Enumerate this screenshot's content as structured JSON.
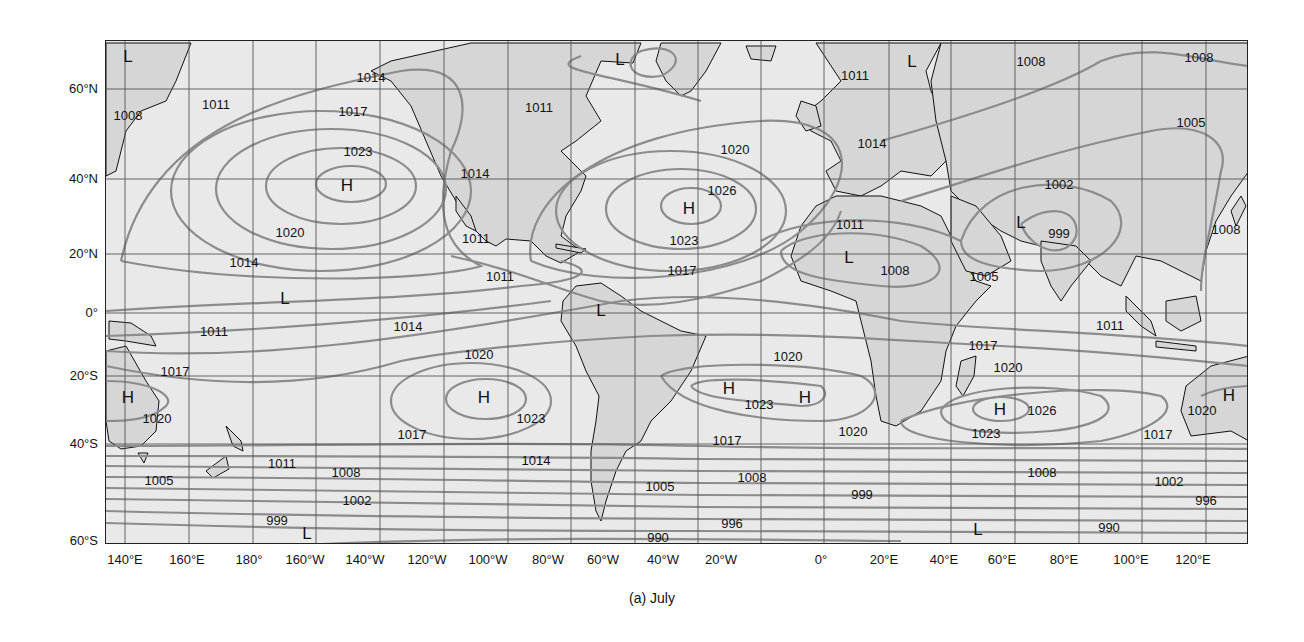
{
  "figure": {
    "caption": "(a) July",
    "type": "Mean sea-level pressure isobar map (mb)"
  },
  "axes": {
    "latitude_labels": [
      {
        "text": "60°N",
        "y": 88
      },
      {
        "text": "40°N",
        "y": 178
      },
      {
        "text": "20°N",
        "y": 253
      },
      {
        "text": "0°",
        "y": 312
      },
      {
        "text": "20°S",
        "y": 375
      },
      {
        "text": "40°S",
        "y": 443
      },
      {
        "text": "60°S",
        "y": 540
      }
    ],
    "longitude_labels": [
      {
        "text": "140°E",
        "x": 125
      },
      {
        "text": "160°E",
        "x": 187
      },
      {
        "text": "180°",
        "x": 249
      },
      {
        "text": "160°W",
        "x": 305
      },
      {
        "text": "140°W",
        "x": 365
      },
      {
        "text": "120°W",
        "x": 427
      },
      {
        "text": "100°W",
        "x": 488
      },
      {
        "text": "80°W",
        "x": 548
      },
      {
        "text": "60°W",
        "x": 603
      },
      {
        "text": "40°W",
        "x": 663
      },
      {
        "text": "20°W",
        "x": 721
      },
      {
        "text": "0°",
        "x": 821
      },
      {
        "text": "20°E",
        "x": 884
      },
      {
        "text": "40°E",
        "x": 944
      },
      {
        "text": "60°E",
        "x": 1002
      },
      {
        "text": "80°E",
        "x": 1064
      },
      {
        "text": "100°E",
        "x": 1131
      },
      {
        "text": "120°E",
        "x": 1193
      }
    ]
  },
  "pressure_centers": [
    {
      "type": "L",
      "x": 128,
      "y": 57
    },
    {
      "type": "L",
      "x": 620,
      "y": 60
    },
    {
      "type": "L",
      "x": 912,
      "y": 62
    },
    {
      "type": "H",
      "x": 347,
      "y": 186
    },
    {
      "type": "H",
      "x": 689,
      "y": 209
    },
    {
      "type": "L",
      "x": 1021,
      "y": 223
    },
    {
      "type": "L",
      "x": 849,
      "y": 258
    },
    {
      "type": "L",
      "x": 285,
      "y": 299
    },
    {
      "type": "L",
      "x": 601,
      "y": 311
    },
    {
      "type": "H",
      "x": 128,
      "y": 398
    },
    {
      "type": "H",
      "x": 484,
      "y": 398
    },
    {
      "type": "H",
      "x": 729,
      "y": 389
    },
    {
      "type": "H",
      "x": 805,
      "y": 398
    },
    {
      "type": "H",
      "x": 1000,
      "y": 410
    },
    {
      "type": "H",
      "x": 1229,
      "y": 396
    },
    {
      "type": "L",
      "x": 307,
      "y": 534
    },
    {
      "type": "L",
      "x": 978,
      "y": 530
    }
  ],
  "isobar_labels": [
    {
      "text": "1014",
      "x": 371,
      "y": 77
    },
    {
      "text": "1008",
      "x": 1031,
      "y": 61
    },
    {
      "text": "1008",
      "x": 1199,
      "y": 57
    },
    {
      "text": "1011",
      "x": 216,
      "y": 104
    },
    {
      "text": "1008",
      "x": 128,
      "y": 115
    },
    {
      "text": "1017",
      "x": 353,
      "y": 111
    },
    {
      "text": "1011",
      "x": 539,
      "y": 107
    },
    {
      "text": "1011",
      "x": 855,
      "y": 75
    },
    {
      "text": "1005",
      "x": 1191,
      "y": 122
    },
    {
      "text": "1023",
      "x": 358,
      "y": 151
    },
    {
      "text": "1020",
      "x": 735,
      "y": 149
    },
    {
      "text": "1014",
      "x": 872,
      "y": 143
    },
    {
      "text": "1014",
      "x": 475,
      "y": 173
    },
    {
      "text": "1026",
      "x": 722,
      "y": 190
    },
    {
      "text": "1002",
      "x": 1059,
      "y": 184
    },
    {
      "text": "1023",
      "x": 684,
      "y": 240
    },
    {
      "text": "1011",
      "x": 850,
      "y": 224
    },
    {
      "text": "999",
      "x": 1059,
      "y": 233
    },
    {
      "text": "1008",
      "x": 1226,
      "y": 229
    },
    {
      "text": "1020",
      "x": 290,
      "y": 232
    },
    {
      "text": "1011",
      "x": 476,
      "y": 238
    },
    {
      "text": "1014",
      "x": 244,
      "y": 262
    },
    {
      "text": "1011",
      "x": 500,
      "y": 276
    },
    {
      "text": "1017",
      "x": 682,
      "y": 270
    },
    {
      "text": "1008",
      "x": 895,
      "y": 270
    },
    {
      "text": "1005",
      "x": 984,
      "y": 276
    },
    {
      "text": "1011",
      "x": 214,
      "y": 331
    },
    {
      "text": "1014",
      "x": 408,
      "y": 326
    },
    {
      "text": "1011",
      "x": 1110,
      "y": 325
    },
    {
      "text": "1020",
      "x": 479,
      "y": 354
    },
    {
      "text": "1020",
      "x": 788,
      "y": 356
    },
    {
      "text": "1017",
      "x": 983,
      "y": 345
    },
    {
      "text": "1020",
      "x": 1008,
      "y": 367
    },
    {
      "text": "1017",
      "x": 175,
      "y": 371
    },
    {
      "text": "1023",
      "x": 531,
      "y": 418
    },
    {
      "text": "1023",
      "x": 759,
      "y": 404
    },
    {
      "text": "1026",
      "x": 1042,
      "y": 410
    },
    {
      "text": "1020",
      "x": 157,
      "y": 418
    },
    {
      "text": "1020",
      "x": 1202,
      "y": 410
    },
    {
      "text": "1017",
      "x": 412,
      "y": 434
    },
    {
      "text": "1017",
      "x": 727,
      "y": 440
    },
    {
      "text": "1020",
      "x": 853,
      "y": 431
    },
    {
      "text": "1023",
      "x": 986,
      "y": 433
    },
    {
      "text": "1017",
      "x": 1158,
      "y": 434
    },
    {
      "text": "1014",
      "x": 536,
      "y": 460
    },
    {
      "text": "1011",
      "x": 282,
      "y": 463
    },
    {
      "text": "1008",
      "x": 346,
      "y": 472
    },
    {
      "text": "1008",
      "x": 752,
      "y": 477
    },
    {
      "text": "1008",
      "x": 1042,
      "y": 472
    },
    {
      "text": "1005",
      "x": 159,
      "y": 480
    },
    {
      "text": "1005",
      "x": 660,
      "y": 486
    },
    {
      "text": "999",
      "x": 862,
      "y": 494
    },
    {
      "text": "1002",
      "x": 1169,
      "y": 481
    },
    {
      "text": "1002",
      "x": 357,
      "y": 500
    },
    {
      "text": "996",
      "x": 1206,
      "y": 500
    },
    {
      "text": "999",
      "x": 277,
      "y": 520
    },
    {
      "text": "996",
      "x": 732,
      "y": 523
    },
    {
      "text": "990",
      "x": 1109,
      "y": 527
    },
    {
      "text": "990",
      "x": 658,
      "y": 537
    }
  ],
  "colors": {
    "frame": "#222222",
    "ocean": "#ebebeb",
    "land": "#d4d4d4",
    "isobar": "#8a8a8a",
    "grid": "#555555",
    "coast": "#111111"
  }
}
